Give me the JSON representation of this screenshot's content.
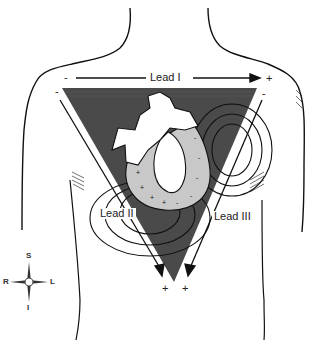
{
  "figure": {
    "colors": {
      "triangle_fill": "#4a4a4a",
      "outline": "#111111",
      "heart_fill": "#ffffff",
      "myocardium_fill": "#c8c8c8",
      "background": "#ffffff"
    }
  },
  "leads": {
    "lead1": {
      "label": "Lead I",
      "neg": "-",
      "pos": "+"
    },
    "lead2": {
      "label": "Lead II",
      "neg": "-",
      "pos": "+"
    },
    "lead3": {
      "label": "Lead III",
      "neg": "-",
      "pos": "+"
    }
  },
  "compass": {
    "top": "S",
    "bottom": "I",
    "left": "R",
    "right": "L"
  }
}
